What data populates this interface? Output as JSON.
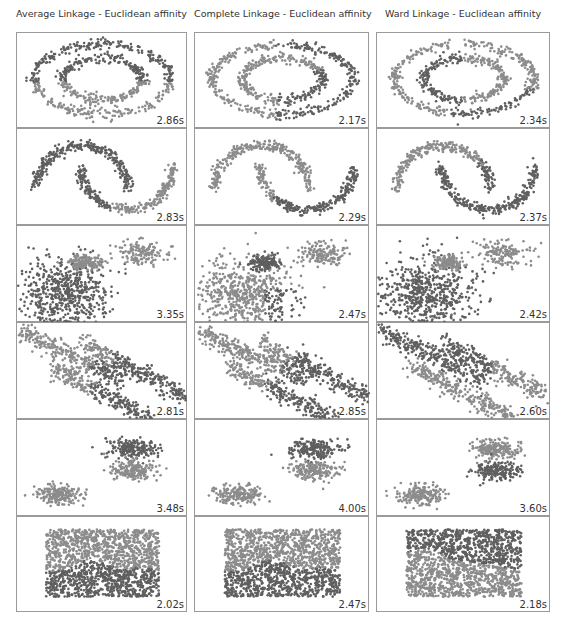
{
  "columns": [
    {
      "title": "Average Linkage - Euclidean affinity"
    },
    {
      "title": "Complete Linkage - Euclidean affinity"
    },
    {
      "title": "Ward Linkage - Euclidean affinity"
    }
  ],
  "colors": {
    "cluster_light": "#8c8c8c",
    "cluster_dark": "#5f5f5f",
    "border": "#9a9a9a"
  },
  "rows": [
    {
      "dataset": "circles",
      "times": [
        "2.86s",
        "2.17s",
        "2.34s"
      ]
    },
    {
      "dataset": "moons",
      "times": [
        "2.83s",
        "2.29s",
        "2.37s"
      ]
    },
    {
      "dataset": "varied_blobs",
      "times": [
        "3.35s",
        "2.47s",
        "2.42s"
      ]
    },
    {
      "dataset": "anisotropic",
      "times": [
        "2.81s",
        "2.85s",
        "2.60s"
      ]
    },
    {
      "dataset": "blobs",
      "times": [
        "3.48s",
        "4.00s",
        "3.60s"
      ]
    },
    {
      "dataset": "uniform_rectangle",
      "times": [
        "2.02s",
        "2.47s",
        "2.18s"
      ]
    }
  ],
  "chart_data": {
    "type": "scatter",
    "layout": {
      "grid_rows": 6,
      "grid_cols": 3,
      "axes": "off",
      "legend": "none"
    },
    "column_labels": [
      "Average Linkage - Euclidean affinity",
      "Complete Linkage - Euclidean affinity",
      "Ward Linkage - Euclidean affinity"
    ],
    "row_datasets": [
      "concentric circles",
      "two moons",
      "blobs with varied variance",
      "anisotropic blobs",
      "three blobs",
      "uniform rectangle (no structure)"
    ],
    "timings_seconds": [
      [
        2.86,
        2.17,
        2.34
      ],
      [
        2.83,
        2.29,
        2.37
      ],
      [
        3.35,
        2.47,
        2.42
      ],
      [
        2.81,
        2.85,
        2.6
      ],
      [
        3.48,
        4.0,
        3.6
      ],
      [
        2.02,
        2.47,
        2.18
      ]
    ],
    "series": [
      {
        "name": "cluster A",
        "color": "#8c8c8c"
      },
      {
        "name": "cluster B",
        "color": "#5f5f5f"
      }
    ]
  }
}
